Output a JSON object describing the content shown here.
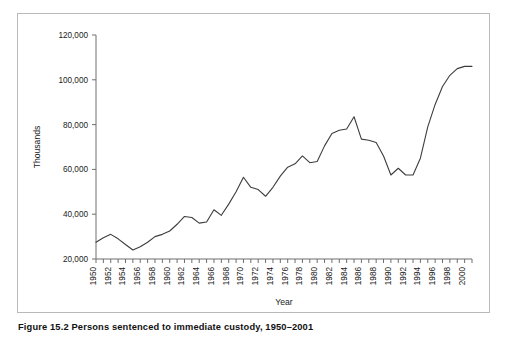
{
  "figure": {
    "caption": "Figure 15.2 Persons sentenced to immediate custody, 1950–2001"
  },
  "chart_data": {
    "type": "line",
    "title": "",
    "xlabel": "Year",
    "ylabel": "Thousands",
    "xlim": [
      1950,
      2001
    ],
    "ylim": [
      20000,
      120000
    ],
    "ytick_labels": [
      "120,000",
      "100,000",
      "80,000",
      "60,000",
      "40,000",
      "20,000"
    ],
    "yticks": [
      120000,
      100000,
      80000,
      60000,
      40000,
      20000
    ],
    "xtick_labels": [
      "1950",
      "1952",
      "1954",
      "1956",
      "1958",
      "1960",
      "1962",
      "1964",
      "1966",
      "1968",
      "1970",
      "1972",
      "1974",
      "1976",
      "1978",
      "1980",
      "1982",
      "1984",
      "1986",
      "1988",
      "1990",
      "1992",
      "1994",
      "1996",
      "1998",
      "2000"
    ],
    "xticks": [
      1950,
      1952,
      1954,
      1956,
      1958,
      1960,
      1962,
      1964,
      1966,
      1968,
      1970,
      1972,
      1974,
      1976,
      1978,
      1980,
      1982,
      1984,
      1986,
      1988,
      1990,
      1992,
      1994,
      1996,
      1998,
      2000
    ],
    "grid": false,
    "legend": false,
    "line_color": "#3d3d3d",
    "x": [
      1950,
      1951,
      1952,
      1953,
      1954,
      1955,
      1956,
      1957,
      1958,
      1959,
      1960,
      1961,
      1962,
      1963,
      1964,
      1965,
      1966,
      1967,
      1968,
      1969,
      1970,
      1971,
      1972,
      1973,
      1974,
      1975,
      1976,
      1977,
      1978,
      1979,
      1980,
      1981,
      1982,
      1983,
      1984,
      1985,
      1986,
      1987,
      1988,
      1989,
      1990,
      1991,
      1992,
      1993,
      1994,
      1995,
      1996,
      1997,
      1998,
      1999,
      2000,
      2001
    ],
    "values": [
      27500,
      29500,
      31000,
      29000,
      26500,
      24000,
      25500,
      27500,
      30000,
      31000,
      32500,
      35500,
      39000,
      38500,
      36000,
      36500,
      42000,
      39500,
      44500,
      50000,
      56500,
      52000,
      51000,
      48000,
      52000,
      57000,
      61000,
      62500,
      66000,
      63000,
      63500,
      70500,
      76000,
      77500,
      78000,
      83500,
      73500,
      73000,
      72000,
      66000,
      57500,
      60500,
      57500,
      57500,
      65000,
      79000,
      89000,
      97000,
      102000,
      105000,
      106000,
      106000
    ],
    "series": [
      {
        "name": "Persons sentenced to immediate custody",
        "values": [
          27500,
          29500,
          31000,
          29000,
          26500,
          24000,
          25500,
          27500,
          30000,
          31000,
          32500,
          35500,
          39000,
          38500,
          36000,
          36500,
          42000,
          39500,
          44500,
          50000,
          56500,
          52000,
          51000,
          48000,
          52000,
          57000,
          61000,
          62500,
          66000,
          63000,
          63500,
          70500,
          76000,
          77500,
          78000,
          83500,
          73500,
          73000,
          72000,
          66000,
          57500,
          60500,
          57500,
          57500,
          65000,
          79000,
          89000,
          97000,
          102000,
          105000,
          106000,
          106000
        ]
      }
    ]
  }
}
